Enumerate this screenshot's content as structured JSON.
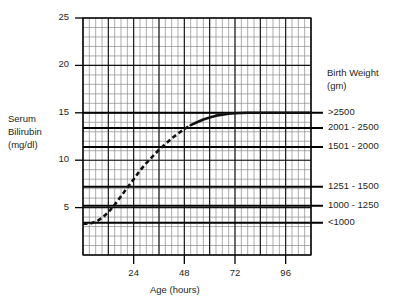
{
  "axes": {
    "y_axis_label_lines": [
      "Serum",
      "Bilirubin",
      "(mg/dl)"
    ],
    "x_axis_label": "Age (hours)",
    "y_ticks": [
      {
        "value": 25,
        "label": "25"
      },
      {
        "value": 20,
        "label": "20"
      },
      {
        "value": 15,
        "label": "15"
      },
      {
        "value": 10,
        "label": "10"
      },
      {
        "value": 5,
        "label": "5"
      }
    ],
    "x_ticks": [
      {
        "value": 24,
        "label": "24"
      },
      {
        "value": 48,
        "label": "48"
      },
      {
        "value": 72,
        "label": "72"
      },
      {
        "value": 96,
        "label": "96"
      }
    ]
  },
  "legend": {
    "title_lines": [
      "Birth Weight",
      "(gm)"
    ],
    "items": [
      {
        "label": ">2500",
        "threshold": 15.0
      },
      {
        "label": "2001 - 2500",
        "threshold": 13.4
      },
      {
        "label": "1501 - 2000",
        "threshold": 11.4
      },
      {
        "label": "1251 - 1500",
        "threshold": 7.2
      },
      {
        "label": "1000 - 1250",
        "threshold": 5.2
      },
      {
        "label": "<1000",
        "threshold": 3.4
      }
    ]
  },
  "chart_data": {
    "type": "line",
    "title": "",
    "xlabel": "Age (hours)",
    "ylabel": "Serum Bilirubin (mg/dl)",
    "xlim": [
      0,
      108
    ],
    "ylim": [
      0,
      25
    ],
    "grid": true,
    "minor_grid_x": 3,
    "minor_grid_y": 1,
    "major_grid_x": 12,
    "major_grid_y": 5,
    "legend_position": "right",
    "series": [
      {
        "name": "Serum bilirubin curve",
        "style": "dashed-then-solid",
        "solid_starts_at_x": 51,
        "points": [
          {
            "x": 0,
            "y": 3.3
          },
          {
            "x": 3,
            "y": 3.3
          },
          {
            "x": 6,
            "y": 3.5
          },
          {
            "x": 9,
            "y": 3.9
          },
          {
            "x": 12,
            "y": 4.5
          },
          {
            "x": 15,
            "y": 5.3
          },
          {
            "x": 18,
            "y": 6.2
          },
          {
            "x": 21,
            "y": 7.1
          },
          {
            "x": 24,
            "y": 8.0
          },
          {
            "x": 27,
            "y": 8.9
          },
          {
            "x": 30,
            "y": 9.7
          },
          {
            "x": 33,
            "y": 10.4
          },
          {
            "x": 36,
            "y": 11.1
          },
          {
            "x": 39,
            "y": 11.7
          },
          {
            "x": 42,
            "y": 12.3
          },
          {
            "x": 45,
            "y": 12.8
          },
          {
            "x": 48,
            "y": 13.3
          },
          {
            "x": 51,
            "y": 13.7
          },
          {
            "x": 54,
            "y": 14.0
          },
          {
            "x": 57,
            "y": 14.3
          },
          {
            "x": 60,
            "y": 14.5
          },
          {
            "x": 63,
            "y": 14.7
          },
          {
            "x": 66,
            "y": 14.8
          },
          {
            "x": 69,
            "y": 14.9
          },
          {
            "x": 72,
            "y": 14.95
          },
          {
            "x": 78,
            "y": 15.0
          },
          {
            "x": 84,
            "y": 15.0
          },
          {
            "x": 90,
            "y": 15.0
          },
          {
            "x": 96,
            "y": 15.0
          },
          {
            "x": 102,
            "y": 15.0
          },
          {
            "x": 108,
            "y": 15.0
          }
        ]
      }
    ],
    "threshold_lines": [
      {
        "label": ">2500",
        "y": 15.0
      },
      {
        "label": "2001 - 2500",
        "y": 13.4
      },
      {
        "label": "1501 - 2000",
        "y": 11.4
      },
      {
        "label": "1251 - 1500",
        "y": 7.2
      },
      {
        "label": "1000 - 1250",
        "y": 5.2
      },
      {
        "label": "<1000",
        "y": 3.4
      }
    ]
  },
  "colors": {
    "ink": "#231f20",
    "grid_minor": "#8a8a8a",
    "grid_major": "#111111",
    "curve": "#111111"
  }
}
